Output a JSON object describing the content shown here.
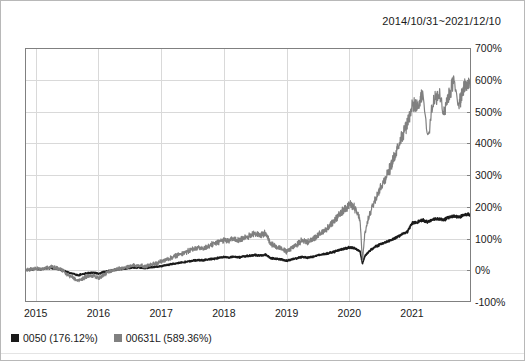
{
  "figure": {
    "date_range_title": "2014/10/31~2021/12/10",
    "background_color": "#ffffff",
    "border_color": "#b8b8b8"
  },
  "legend": {
    "position": "bottom-left",
    "entries": [
      {
        "swatch_name": "legend-swatch-0050",
        "label": "0050 (176.12%)",
        "color": "#1a1a1a"
      },
      {
        "swatch_name": "legend-swatch-00631L",
        "label": "00631L (589.36%)",
        "color": "#808080"
      }
    ]
  },
  "axes": {
    "y_tick_labels": [
      "700%",
      "600%",
      "500%",
      "400%",
      "300%",
      "200%",
      "100%",
      "0%",
      "-100%"
    ],
    "x_tick_labels": [
      "2015",
      "2016",
      "2017",
      "2018",
      "2019",
      "2020",
      "2021"
    ],
    "y_label_side": "right",
    "grid_color": "#d9d9d9",
    "axis_color": "#808080"
  },
  "chart_data": {
    "type": "line",
    "title": "2014/10/31~2021/12/10",
    "xlabel": "",
    "ylabel": "",
    "ylim": [
      -100,
      700
    ],
    "xlim": [
      2014.83,
      2021.94
    ],
    "y_ticks": [
      -100,
      0,
      100,
      200,
      300,
      400,
      500,
      600,
      700
    ],
    "y_tick_labels": [
      "-100%",
      "0%",
      "100%",
      "200%",
      "300%",
      "400%",
      "500%",
      "600%",
      "700%"
    ],
    "x_ticks": [
      2015,
      2016,
      2017,
      2018,
      2019,
      2020,
      2021
    ],
    "x_tick_labels": [
      "2015",
      "2016",
      "2017",
      "2018",
      "2019",
      "2020",
      "2021"
    ],
    "grid": true,
    "legend_position": "below-axes-left",
    "units": "percent cumulative return",
    "final_values": {
      "0050": 176.12,
      "00631L": 589.36
    },
    "series": [
      {
        "name": "0050 (176.12%)",
        "short_name": "0050",
        "color": "#1a1a1a",
        "final_value": 176.12,
        "x": [
          2014.83,
          2014.92,
          2015.0,
          2015.08,
          2015.17,
          2015.25,
          2015.33,
          2015.42,
          2015.5,
          2015.58,
          2015.67,
          2015.75,
          2015.83,
          2015.92,
          2016.0,
          2016.08,
          2016.17,
          2016.25,
          2016.33,
          2016.42,
          2016.5,
          2016.58,
          2016.67,
          2016.75,
          2016.83,
          2016.92,
          2017.0,
          2017.08,
          2017.17,
          2017.25,
          2017.33,
          2017.42,
          2017.5,
          2017.58,
          2017.67,
          2017.75,
          2017.83,
          2017.92,
          2018.0,
          2018.08,
          2018.17,
          2018.25,
          2018.33,
          2018.42,
          2018.5,
          2018.58,
          2018.67,
          2018.75,
          2018.83,
          2018.92,
          2019.0,
          2019.08,
          2019.17,
          2019.25,
          2019.33,
          2019.42,
          2019.5,
          2019.58,
          2019.67,
          2019.75,
          2019.83,
          2019.92,
          2020.0,
          2020.08,
          2020.17,
          2020.21,
          2020.25,
          2020.33,
          2020.42,
          2020.5,
          2020.58,
          2020.67,
          2020.75,
          2020.83,
          2020.92,
          2021.0,
          2021.08,
          2021.17,
          2021.25,
          2021.33,
          2021.42,
          2021.5,
          2021.58,
          2021.67,
          2021.75,
          2021.83,
          2021.92
        ],
        "y": [
          0,
          2,
          4,
          3,
          6,
          7,
          5,
          2,
          -6,
          -10,
          -16,
          -12,
          -9,
          -8,
          -11,
          -6,
          -2,
          1,
          3,
          5,
          7,
          9,
          8,
          6,
          9,
          11,
          13,
          16,
          19,
          22,
          25,
          27,
          30,
          32,
          31,
          34,
          36,
          39,
          42,
          40,
          43,
          41,
          44,
          46,
          48,
          46,
          49,
          38,
          36,
          34,
          30,
          34,
          38,
          42,
          40,
          43,
          47,
          50,
          54,
          58,
          63,
          68,
          72,
          70,
          60,
          22,
          45,
          62,
          75,
          82,
          88,
          95,
          104,
          112,
          120,
          148,
          152,
          158,
          152,
          160,
          163,
          158,
          166,
          170,
          168,
          174,
          176
        ]
      },
      {
        "name": "00631L (589.36%)",
        "short_name": "00631L",
        "color": "#808080",
        "final_value": 589.36,
        "x": [
          2014.83,
          2014.92,
          2015.0,
          2015.08,
          2015.17,
          2015.25,
          2015.33,
          2015.42,
          2015.5,
          2015.58,
          2015.67,
          2015.75,
          2015.83,
          2015.92,
          2016.0,
          2016.08,
          2016.17,
          2016.25,
          2016.33,
          2016.42,
          2016.5,
          2016.58,
          2016.67,
          2016.75,
          2016.83,
          2016.92,
          2017.0,
          2017.08,
          2017.17,
          2017.25,
          2017.33,
          2017.42,
          2017.5,
          2017.58,
          2017.67,
          2017.75,
          2017.83,
          2017.92,
          2018.0,
          2018.08,
          2018.17,
          2018.25,
          2018.33,
          2018.42,
          2018.5,
          2018.58,
          2018.67,
          2018.75,
          2018.83,
          2018.92,
          2019.0,
          2019.08,
          2019.17,
          2019.25,
          2019.33,
          2019.42,
          2019.5,
          2019.58,
          2019.67,
          2019.75,
          2019.83,
          2019.92,
          2020.0,
          2020.08,
          2020.17,
          2020.21,
          2020.25,
          2020.33,
          2020.42,
          2020.5,
          2020.58,
          2020.67,
          2020.75,
          2020.83,
          2020.92,
          2021.0,
          2021.08,
          2021.17,
          2021.25,
          2021.33,
          2021.42,
          2021.5,
          2021.58,
          2021.67,
          2021.75,
          2021.83,
          2021.92
        ],
        "y": [
          0,
          3,
          6,
          4,
          9,
          11,
          7,
          1,
          -14,
          -22,
          -33,
          -25,
          -19,
          -17,
          -24,
          -14,
          -5,
          1,
          5,
          9,
          13,
          17,
          15,
          11,
          17,
          22,
          27,
          33,
          40,
          47,
          54,
          59,
          66,
          71,
          68,
          76,
          82,
          89,
          97,
          92,
          100,
          95,
          103,
          110,
          116,
          110,
          118,
          82,
          76,
          70,
          58,
          70,
          82,
          95,
          88,
          98,
          110,
          122,
          136,
          152,
          172,
          192,
          208,
          198,
          160,
          28,
          120,
          180,
          230,
          262,
          292,
          330,
          378,
          420,
          462,
          520,
          510,
          560,
          415,
          520,
          560,
          498,
          548,
          600,
          520,
          575,
          589
        ]
      }
    ]
  }
}
